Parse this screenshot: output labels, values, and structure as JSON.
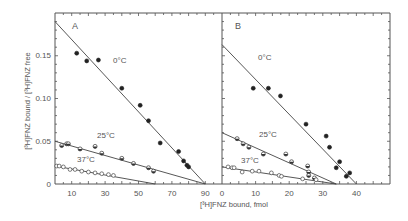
{
  "chart_data": [
    {
      "type": "scatter",
      "panel": "A",
      "xlabel": "[3H]FNZ bound, fmol",
      "ylabel": "[3H]FNZ bound / [3H]FNZ free",
      "xlim": [
        0,
        100
      ],
      "ylim": [
        0,
        0.2
      ],
      "xticks": [
        10,
        30,
        50,
        70,
        90
      ],
      "xtick_labels": [
        "10",
        "30",
        "50",
        "70",
        "90"
      ],
      "yticks": [
        0,
        0.05,
        0.1,
        0.15
      ],
      "ytick_labels": [
        "0",
        "0.05",
        "0.10",
        "0.15"
      ],
      "grid": false,
      "series": [
        {
          "name": "0°C",
          "marker": "filled",
          "points": [
            [
              13,
              0.153
            ],
            [
              19,
              0.144
            ],
            [
              26,
              0.145
            ],
            [
              40,
              0.112
            ],
            [
              51,
              0.092
            ],
            [
              56,
              0.074
            ],
            [
              63,
              0.048
            ],
            [
              74,
              0.038
            ],
            [
              77,
              0.027
            ],
            [
              80,
              0.02
            ],
            [
              79,
              0.022
            ]
          ],
          "fit": [
            [
              0,
              0.19
            ],
            [
              90,
              0
            ]
          ]
        },
        {
          "name": "25°C",
          "marker": "half-filled",
          "points": [
            [
              4,
              0.045
            ],
            [
              7,
              0.047
            ],
            [
              8,
              0.047
            ],
            [
              15,
              0.041
            ],
            [
              24,
              0.044
            ],
            [
              28,
              0.036
            ],
            [
              40,
              0.03
            ],
            [
              47,
              0.024
            ],
            [
              56,
              0.019
            ],
            [
              59,
              0.015
            ]
          ],
          "fit": [
            [
              0,
              0.05
            ],
            [
              90,
              0
            ]
          ]
        },
        {
          "name": "37°C",
          "marker": "open",
          "points": [
            [
              1,
              0.021
            ],
            [
              2.5,
              0.021
            ],
            [
              5,
              0.02
            ],
            [
              9,
              0.017
            ],
            [
              12,
              0.017
            ],
            [
              16,
              0.015
            ],
            [
              20,
              0.014
            ],
            [
              24,
              0.013
            ],
            [
              28,
              0.012
            ],
            [
              32,
              0.011
            ],
            [
              35,
              0.01
            ]
          ],
          "fit": [
            [
              0,
              0.021
            ],
            [
              60,
              0
            ]
          ]
        }
      ]
    },
    {
      "type": "scatter",
      "panel": "B",
      "xlabel": "[3H]FNZ bound, fmol",
      "ylabel": "",
      "xlim": [
        0,
        50
      ],
      "ylim": [
        0,
        0.2
      ],
      "xticks": [
        0,
        10,
        20,
        30,
        40
      ],
      "xtick_labels": [
        "0",
        "10",
        "20",
        "30",
        "40"
      ],
      "grid": false,
      "series": [
        {
          "name": "0°C",
          "marker": "filled",
          "points": [
            [
              9.3,
              0.112
            ],
            [
              13.8,
              0.112
            ],
            [
              17.4,
              0.103
            ],
            [
              25,
              0.07
            ],
            [
              31,
              0.056
            ],
            [
              32,
              0.043
            ],
            [
              35,
              0.026
            ],
            [
              34,
              0.019
            ],
            [
              38,
              0.013
            ],
            [
              37,
              0.009
            ]
          ],
          "fit": [
            [
              0,
              0.163
            ],
            [
              40,
              0
            ]
          ]
        },
        {
          "name": "25°C",
          "marker": "half-filled",
          "points": [
            [
              4.5,
              0.053
            ],
            [
              6.3,
              0.047
            ],
            [
              8,
              0.043
            ],
            [
              12.3,
              0.035
            ],
            [
              19,
              0.035
            ],
            [
              20.7,
              0.026
            ],
            [
              25.5,
              0.021
            ],
            [
              25.8,
              0.014
            ],
            [
              25.8,
              0.01
            ],
            [
              27.5,
              0.007
            ]
          ],
          "fit": [
            [
              0,
              0.06
            ],
            [
              34,
              0
            ]
          ]
        },
        {
          "name": "37°C",
          "marker": "open",
          "points": [
            [
              1.8,
              0.02
            ],
            [
              3,
              0.019
            ],
            [
              3.6,
              0.019
            ],
            [
              6,
              0.014
            ],
            [
              9,
              0.015
            ],
            [
              11,
              0.015
            ],
            [
              14.7,
              0.013
            ],
            [
              17,
              0.01
            ],
            [
              17.7,
              0.009
            ],
            [
              24,
              0.006
            ],
            [
              28,
              0.005
            ]
          ],
          "fit": [
            [
              0,
              0.02
            ],
            [
              34,
              0
            ]
          ]
        }
      ]
    }
  ],
  "labels": {
    "panel_a": "A",
    "panel_b": "B",
    "x_title": "[³H]FNZ  bound,  fmol",
    "y_title": "[³H]FNZ  bound  /  [³H]FNZ  free",
    "a_0c": "0°C",
    "a_25c": "25°C",
    "a_37c": "37°C",
    "b_0c": "0°C",
    "b_25c": "25°C",
    "b_37c": "37°C",
    "y_0": "0",
    "y_005": "0.05",
    "y_010": "0.10",
    "y_015": "0.15"
  }
}
